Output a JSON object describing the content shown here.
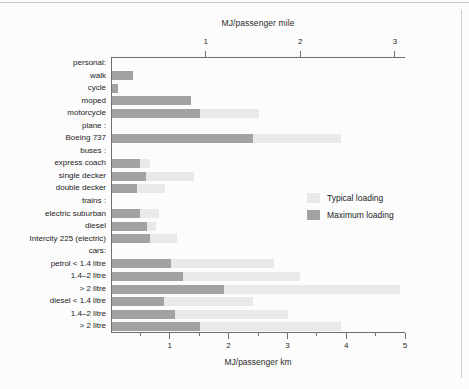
{
  "chart_data": {
    "type": "bar",
    "orientation": "horizontal",
    "title": "",
    "xlabel": "MJ/passenger km",
    "xlabel_top": "MJ/passenger mile",
    "ylabel": "",
    "xlim": [
      0,
      5
    ],
    "xlim_top": [
      0,
      3.10686
    ],
    "xticks": [
      1,
      2,
      3,
      4,
      5
    ],
    "xticks_minor": [
      0.5,
      1.5,
      2.5,
      3.5,
      4.5
    ],
    "xticks_top": [
      1,
      2,
      3
    ],
    "grid": false,
    "legend_position": "center-right",
    "series": [
      {
        "name": "Typical loading",
        "color": "#e9e9e9"
      },
      {
        "name": "Maximum loading",
        "color": "#a2a2a2"
      }
    ],
    "categories": [
      "personal:",
      "walk",
      "cycle",
      "moped",
      "motorcycle",
      "plane :",
      "Boeing 737",
      "buses :",
      "express coach",
      "single decker",
      "double decker",
      "trains :",
      "electric suburban",
      "diesel",
      "Intercity 225 (electric)",
      "cars:",
      "petrol < 1.4 litre",
      "1.4–2 litre",
      "> 2 litre",
      "diesel < 1.4 litre",
      "1.4–2 litre",
      "> 2 litre"
    ],
    "rows": [
      {
        "label": "personal:",
        "header": true,
        "typical": null,
        "maximum": null
      },
      {
        "label": "walk",
        "header": false,
        "typical": 0.35,
        "maximum": 0.35
      },
      {
        "label": "cycle",
        "header": false,
        "typical": 0.1,
        "maximum": 0.1
      },
      {
        "label": "moped",
        "header": false,
        "typical": 1.35,
        "maximum": 1.35
      },
      {
        "label": "motorcycle",
        "header": false,
        "typical": 2.5,
        "maximum": 1.5
      },
      {
        "label": "plane :",
        "header": true,
        "typical": null,
        "maximum": null
      },
      {
        "label": "Boeing 737",
        "header": false,
        "typical": 3.9,
        "maximum": 2.4
      },
      {
        "label": "buses :",
        "header": true,
        "typical": null,
        "maximum": null
      },
      {
        "label": "express coach",
        "header": false,
        "typical": 0.65,
        "maximum": 0.47
      },
      {
        "label": "single decker",
        "header": false,
        "typical": 1.4,
        "maximum": 0.58
      },
      {
        "label": "double decker",
        "header": false,
        "typical": 0.9,
        "maximum": 0.42
      },
      {
        "label": "trains :",
        "header": true,
        "typical": null,
        "maximum": null
      },
      {
        "label": "electric suburban",
        "header": false,
        "typical": 0.8,
        "maximum": 0.47
      },
      {
        "label": "diesel",
        "header": false,
        "typical": 0.75,
        "maximum": 0.6
      },
      {
        "label": "Intercity 225 (electric)",
        "header": false,
        "typical": 1.1,
        "maximum": 0.65
      },
      {
        "label": "cars:",
        "header": true,
        "typical": null,
        "maximum": null
      },
      {
        "label": "petrol < 1.4 litre",
        "header": false,
        "typical": 2.75,
        "maximum": 1.0
      },
      {
        "label": "1.4–2 litre",
        "header": false,
        "typical": 3.2,
        "maximum": 1.2
      },
      {
        "label": "> 2 litre",
        "header": false,
        "typical": 4.9,
        "maximum": 1.9
      },
      {
        "label": "diesel < 1.4 litre",
        "header": false,
        "typical": 2.4,
        "maximum": 0.88
      },
      {
        "label": "1.4–2 litre",
        "header": false,
        "typical": 3.0,
        "maximum": 1.07
      },
      {
        "label": "> 2 litre",
        "header": false,
        "typical": 3.9,
        "maximum": 1.5
      }
    ]
  },
  "axes": {
    "top_title": "MJ/passenger mile",
    "bottom_title": "MJ/passenger km",
    "top_ticklabels": [
      "1",
      "2",
      "3"
    ],
    "bottom_ticklabels": [
      "1",
      "2",
      "3",
      "4",
      "5"
    ]
  },
  "legend": {
    "items": [
      {
        "label": "Typical loading",
        "color": "#e9e9e9"
      },
      {
        "label": "Maximum loading",
        "color": "#a2a2a2"
      }
    ]
  },
  "colors": {
    "typical": "#e9e9e9",
    "maximum": "#a2a2a2",
    "axis": "#6f6f6f",
    "text": "#232323",
    "background": "#fcfcfc"
  }
}
